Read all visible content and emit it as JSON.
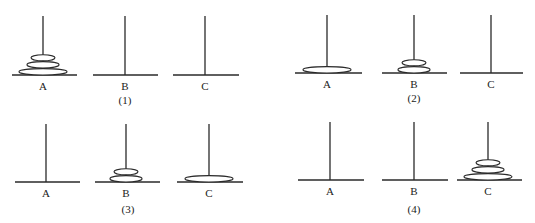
{
  "colors": {
    "stroke": "#2a2a2a",
    "disk_fill": "#ffffff",
    "background": "#ffffff"
  },
  "panels": [
    {
      "caption": "(1)",
      "caption_pos": [
        125,
        95
      ],
      "base_y": 75,
      "pole_top": 16,
      "pegs": [
        {
          "label": "A",
          "x": 43,
          "base": [
            12,
            77
          ],
          "disks": [
            3,
            2,
            1
          ]
        },
        {
          "label": "B",
          "x": 125,
          "base": [
            93,
            158
          ],
          "disks": []
        },
        {
          "label": "C",
          "x": 205,
          "base": [
            173,
            239
          ],
          "disks": []
        }
      ]
    },
    {
      "caption": "(2)",
      "caption_pos": [
        414,
        93
      ],
      "base_y": 73,
      "pole_top": 15,
      "pegs": [
        {
          "label": "A",
          "x": 327,
          "base": [
            295,
            362
          ],
          "disks": [
            3
          ]
        },
        {
          "label": "B",
          "x": 414,
          "base": [
            382,
            447
          ],
          "disks": [
            2,
            1
          ]
        },
        {
          "label": "C",
          "x": 491,
          "base": [
            460,
            523
          ],
          "disks": []
        }
      ]
    },
    {
      "caption": "(3)",
      "caption_pos": [
        128,
        204
      ],
      "base_y": 182,
      "pole_top": 124,
      "pegs": [
        {
          "label": "A",
          "x": 46,
          "base": [
            15,
            80
          ],
          "disks": []
        },
        {
          "label": "B",
          "x": 126,
          "base": [
            95,
            160
          ],
          "disks": [
            2,
            1
          ]
        },
        {
          "label": "C",
          "x": 209,
          "base": [
            177,
            243
          ],
          "disks": [
            3
          ]
        }
      ]
    },
    {
      "caption": "(4)",
      "caption_pos": [
        414,
        204
      ],
      "base_y": 180,
      "pole_top": 122,
      "pegs": [
        {
          "label": "A",
          "x": 330,
          "base": [
            298,
            364
          ],
          "disks": []
        },
        {
          "label": "B",
          "x": 414,
          "base": [
            382,
            448
          ],
          "disks": []
        },
        {
          "label": "C",
          "x": 488,
          "base": [
            457,
            522
          ],
          "disks": [
            3,
            2,
            1
          ]
        }
      ]
    }
  ],
  "disk_sizes": {
    "1": {
      "rx": 12,
      "ry": 3
    },
    "2": {
      "rx": 16,
      "ry": 3.2
    },
    "3": {
      "rx": 24,
      "ry": 3.2
    }
  }
}
